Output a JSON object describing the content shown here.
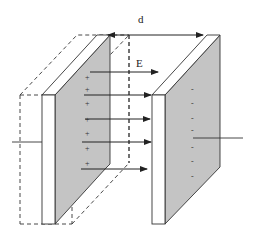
{
  "diagram": {
    "labels": {
      "distance": "d",
      "field": "E"
    },
    "left_plate": {
      "charge_sign": "+",
      "charge_marks": 7
    },
    "right_plate": {
      "charge_sign": "-",
      "charge_marks": 7
    },
    "field_arrows": 5,
    "colors": {
      "plate_shade": "#c4c4c4",
      "plate_face": "#ffffff",
      "stroke": "#333333",
      "background": "#ffffff"
    }
  }
}
